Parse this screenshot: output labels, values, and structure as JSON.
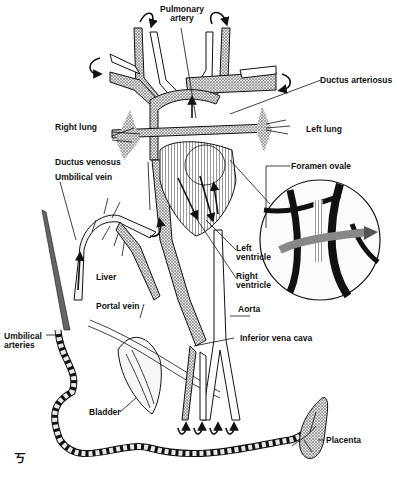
{
  "figure": {
    "labels": {
      "pulmonary_artery": "Pulmonary\nartery",
      "pulmonary_artery_l1": "Pulmonary",
      "pulmonary_artery_l2": "artery",
      "ductus_arteriosus": "Ductus arteriosus",
      "right_lung": "Right lung",
      "left_lung": "Left lung",
      "ductus_venosus": "Ductus venosus",
      "umbilical_vein": "Umbilical vein",
      "foramen_ovale": "Foramen ovale",
      "left_ventricle_l1": "Left",
      "left_ventricle_l2": "ventricle",
      "right_ventricle_l1": "Right",
      "right_ventricle_l2": "ventricle",
      "liver": "Liver",
      "portal_vein": "Portal vein",
      "aorta": "Aorta",
      "inferior_vena_cava": "Inferior vena cava",
      "umbilical_arteries_l1": "Umbilical",
      "umbilical_arteries_l2": "arteries",
      "bladder": "Bladder",
      "placenta": "Placenta"
    },
    "signature": "ㄎ"
  }
}
